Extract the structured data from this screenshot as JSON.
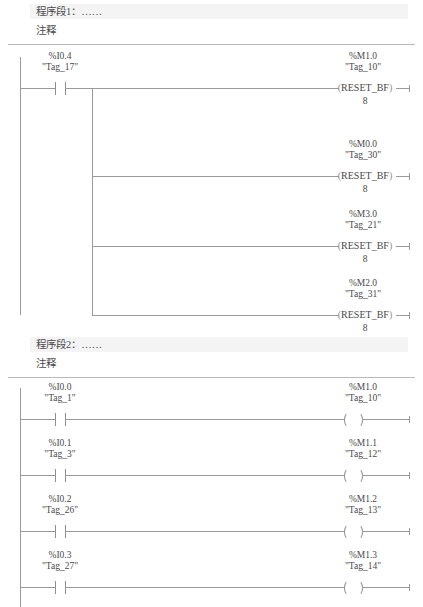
{
  "document": {
    "language": "LAD",
    "line_color": "#9a9a9a",
    "text_color": "#4a4a4a",
    "titlebar_color": "#f4f4f4"
  },
  "networks": [
    {
      "title": "程序段1：……",
      "comment": "注释",
      "rungs": [
        {
          "contact": {
            "address": "%I0.4",
            "tag": "\"Tag_17\"",
            "type": "no-contact"
          },
          "coil": {
            "address": "%M1.0",
            "tag": "\"Tag_10\"",
            "type": "reset-bf-coil",
            "label": "RESET_BF",
            "parameter": "8"
          }
        },
        {
          "contact": null,
          "coil": {
            "address": "%M0.0",
            "tag": "\"Tag_30\"",
            "type": "reset-bf-coil",
            "label": "RESET_BF",
            "parameter": "8"
          }
        },
        {
          "contact": null,
          "coil": {
            "address": "%M3.0",
            "tag": "\"Tag_21\"",
            "type": "reset-bf-coil",
            "label": "RESET_BF",
            "parameter": "8"
          }
        },
        {
          "contact": null,
          "coil": {
            "address": "%M2.0",
            "tag": "\"Tag_31\"",
            "type": "reset-bf-coil",
            "label": "RESET_BF",
            "parameter": "8"
          }
        }
      ]
    },
    {
      "title": "程序段2：……",
      "comment": "注释",
      "rungs": [
        {
          "contact": {
            "address": "%I0.0",
            "tag": "\"Tag_1\"",
            "type": "no-contact"
          },
          "coil": {
            "address": "%M1.0",
            "tag": "\"Tag_10\"",
            "type": "coil"
          }
        },
        {
          "contact": {
            "address": "%I0.1",
            "tag": "\"Tag_3\"",
            "type": "no-contact"
          },
          "coil": {
            "address": "%M1.1",
            "tag": "\"Tag_12\"",
            "type": "coil"
          }
        },
        {
          "contact": {
            "address": "%I0.2",
            "tag": "\"Tag_26\"",
            "type": "no-contact"
          },
          "coil": {
            "address": "%M1.2",
            "tag": "\"Tag_13\"",
            "type": "coil"
          }
        },
        {
          "contact": {
            "address": "%I0.3",
            "tag": "\"Tag_27\"",
            "type": "no-contact"
          },
          "coil": {
            "address": "%M1.3",
            "tag": "\"Tag_14\"",
            "type": "coil"
          }
        }
      ]
    }
  ]
}
